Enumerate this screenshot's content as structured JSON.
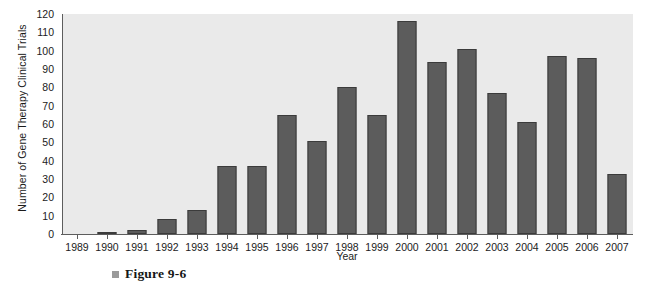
{
  "chart_data": {
    "type": "bar",
    "title": "",
    "xlabel": "Year",
    "ylabel": "Number of Gene Therapy Clinical Trials",
    "categories": [
      "1989",
      "1990",
      "1991",
      "1992",
      "1993",
      "1994",
      "1995",
      "1996",
      "1997",
      "1998",
      "1999",
      "2000",
      "2001",
      "2002",
      "2003",
      "2004",
      "2005",
      "2006",
      "2007"
    ],
    "values": [
      0,
      1,
      2,
      8,
      13,
      37,
      37,
      65,
      51,
      80,
      65,
      116,
      94,
      101,
      77,
      61,
      97,
      96,
      33
    ],
    "ylim": [
      0,
      120
    ],
    "yticks": [
      0,
      10,
      20,
      30,
      40,
      50,
      60,
      70,
      80,
      90,
      100,
      110,
      120
    ],
    "ytick_labels": [
      "0",
      "10",
      "20",
      "30",
      "40",
      "50",
      "60",
      "70",
      "80",
      "90",
      "100",
      "110",
      "120"
    ],
    "grid": false,
    "legend": "none",
    "bar_color": "#5c5c5c",
    "bar_edge_color": "#3b3b3b",
    "plot_background": "#eaeaea",
    "axis_color": "#5d5d5d",
    "text_color": "#1b1b1b"
  },
  "caption": {
    "bullet": "square-bullet",
    "text": "Figure 9-6"
  }
}
